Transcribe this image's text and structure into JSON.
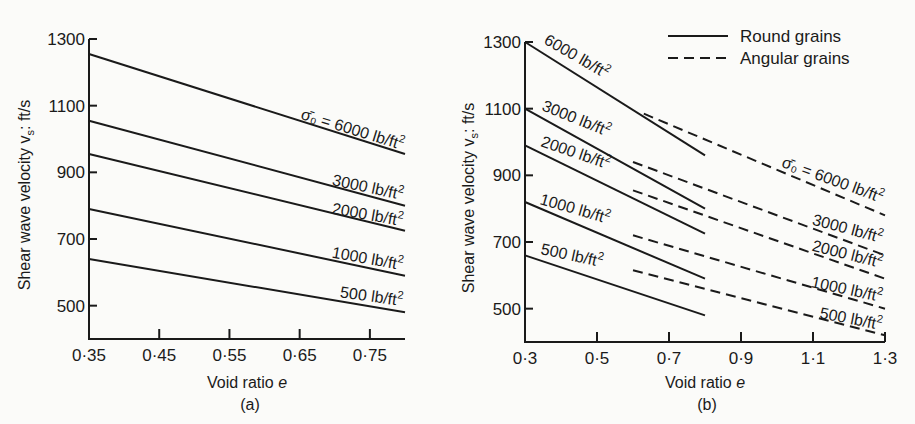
{
  "figure": {
    "panel_labels": [
      "(a)",
      "(b)"
    ]
  },
  "chart_data": [
    {
      "type": "line",
      "panel": "(a)",
      "title": "",
      "xlabel": "Void ratio e",
      "ylabel": "Shear wave velocity v_s: ft/s",
      "ylabel_main": "Shear wave velocity v",
      "ylabel_sub": "s",
      "ylabel_tail": ": ft/s",
      "xlim": [
        0.35,
        0.8
      ],
      "ylim": [
        400,
        1300
      ],
      "xticks": [
        0.35,
        0.45,
        0.55,
        0.65,
        0.75
      ],
      "xtick_labels": [
        "0·35",
        "0·45",
        "0·55",
        "0·65",
        "0·75"
      ],
      "yticks": [
        500,
        700,
        900,
        1100,
        1300
      ],
      "ytick_labels": [
        "500",
        "700",
        "900",
        "1100",
        "1300"
      ],
      "grid": false,
      "series": [
        {
          "name": "σ̄0 = 6000 lb/ft²",
          "label": "σ̄₀ = 6000 lb/ft²",
          "style": "solid",
          "x": [
            0.35,
            0.8
          ],
          "y": [
            1255,
            955
          ]
        },
        {
          "name": "3000 lb/ft²",
          "label": "3000 lb/ft²",
          "style": "solid",
          "x": [
            0.35,
            0.8
          ],
          "y": [
            1055,
            800
          ]
        },
        {
          "name": "2000 lb/ft²",
          "label": "2000 lb/ft²",
          "style": "solid",
          "x": [
            0.35,
            0.8
          ],
          "y": [
            955,
            725
          ]
        },
        {
          "name": "1000 lb/ft²",
          "label": "1000 lb/ft²",
          "style": "solid",
          "x": [
            0.35,
            0.8
          ],
          "y": [
            790,
            590
          ]
        },
        {
          "name": "500 lb/ft²",
          "label": "500 lb/ft²",
          "style": "solid",
          "x": [
            0.35,
            0.8
          ],
          "y": [
            640,
            480
          ]
        }
      ]
    },
    {
      "type": "line",
      "panel": "(b)",
      "title": "",
      "xlabel": "Void ratio e",
      "ylabel": "Shear wave velocity v_s: ft/s",
      "ylabel_main": "Shear wave velocity v",
      "ylabel_sub": "s",
      "ylabel_tail": ": ft/s",
      "xlim": [
        0.3,
        1.3
      ],
      "ylim": [
        400,
        1300
      ],
      "xticks": [
        0.3,
        0.5,
        0.7,
        0.9,
        1.1,
        1.3
      ],
      "xtick_labels": [
        "0·3",
        "0·5",
        "0·7",
        "0·9",
        "1·1",
        "1·3"
      ],
      "yticks": [
        500,
        700,
        900,
        1100,
        1300
      ],
      "ytick_labels": [
        "500",
        "700",
        "900",
        "1100",
        "1300"
      ],
      "grid": false,
      "legend": {
        "position": "top-right",
        "entries": [
          {
            "label": "Round grains",
            "style": "solid"
          },
          {
            "label": "Angular grains",
            "style": "dashed"
          }
        ]
      },
      "series": [
        {
          "name": "Round grains 6000 lb/ft²",
          "label": "6000 lb/ft²",
          "style": "solid",
          "x": [
            0.3,
            0.8
          ],
          "y": [
            1300,
            960
          ]
        },
        {
          "name": "Round grains 3000 lb/ft²",
          "label": "3000 lb/ft²",
          "style": "solid",
          "x": [
            0.3,
            0.8
          ],
          "y": [
            1100,
            800
          ]
        },
        {
          "name": "Round grains 2000 lb/ft²",
          "label": "2000 lb/ft²",
          "style": "solid",
          "x": [
            0.3,
            0.8
          ],
          "y": [
            990,
            725
          ]
        },
        {
          "name": "Round grains 1000 lb/ft²",
          "label": "1000 lb/ft²",
          "style": "solid",
          "x": [
            0.3,
            0.8
          ],
          "y": [
            820,
            590
          ]
        },
        {
          "name": "Round grains 500 lb/ft²",
          "label": "500 lb/ft²",
          "style": "solid",
          "x": [
            0.3,
            0.8
          ],
          "y": [
            660,
            480
          ]
        },
        {
          "name": "Angular grains 6000 lb/ft²",
          "label": "σ̄₀ = 6000 lb/ft²",
          "style": "dashed",
          "x": [
            0.63,
            1.3
          ],
          "y": [
            1085,
            780
          ]
        },
        {
          "name": "Angular grains 3000 lb/ft²",
          "label": "3000 lb/ft²",
          "style": "dashed",
          "x": [
            0.6,
            1.3
          ],
          "y": [
            940,
            660
          ]
        },
        {
          "name": "Angular grains 2000 lb/ft²",
          "label": "2000 lb/ft²",
          "style": "dashed",
          "x": [
            0.6,
            1.3
          ],
          "y": [
            855,
            590
          ]
        },
        {
          "name": "Angular grains 1000 lb/ft²",
          "label": "1000 lb/ft²",
          "style": "dashed",
          "x": [
            0.6,
            1.3
          ],
          "y": [
            720,
            500
          ]
        },
        {
          "name": "Angular grains 500 lb/ft²",
          "label": "500 lb/ft²",
          "style": "dashed",
          "x": [
            0.6,
            1.3
          ],
          "y": [
            615,
            420
          ]
        }
      ]
    }
  ]
}
